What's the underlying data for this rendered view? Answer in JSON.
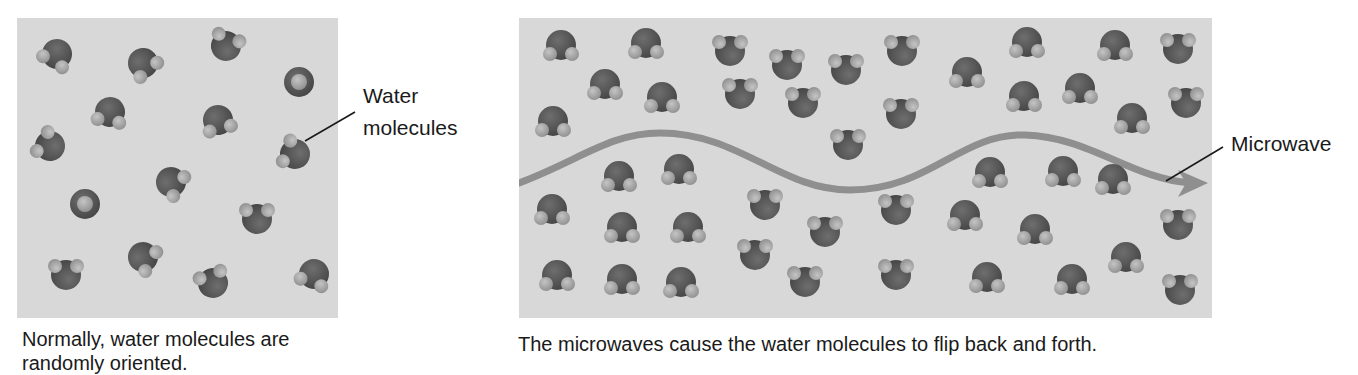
{
  "figure": {
    "left_panel": {
      "label": {
        "line1": "Water",
        "line2": "molecules"
      },
      "caption": {
        "line1": "Normally, water molecules are",
        "line2": "randomly oriented."
      },
      "molecules": [
        {
          "x": 57,
          "y": 54,
          "rot": 30
        },
        {
          "x": 143,
          "y": 63,
          "rot": -40
        },
        {
          "x": 226,
          "y": 46,
          "rot": 200
        },
        {
          "x": 299,
          "y": 82,
          "rot": 0,
          "front": true
        },
        {
          "x": 110,
          "y": 112,
          "rot": 10
        },
        {
          "x": 218,
          "y": 120,
          "rot": -15
        },
        {
          "x": 50,
          "y": 146,
          "rot": 120
        },
        {
          "x": 295,
          "y": 154,
          "rot": 110
        },
        {
          "x": 171,
          "y": 182,
          "rot": -60
        },
        {
          "x": 85,
          "y": 204,
          "rot": 0,
          "front": true
        },
        {
          "x": 257,
          "y": 219,
          "rot": 180
        },
        {
          "x": 143,
          "y": 257,
          "rot": -60
        },
        {
          "x": 66,
          "y": 275,
          "rot": 180
        },
        {
          "x": 213,
          "y": 283,
          "rot": 160
        },
        {
          "x": 314,
          "y": 274,
          "rot": 20
        }
      ]
    },
    "right_panel": {
      "label": "Microwave",
      "caption": "The microwaves cause the water molecules to flip back and forth.",
      "wave_path": "M519,183 C580,160 610,133 660,133 C740,133 780,190 850,190 C930,190 960,133 1025,135 C1090,137 1130,178 1190,183",
      "molecules_down": [
        {
          "x": 561,
          "y": 45
        },
        {
          "x": 646,
          "y": 43
        },
        {
          "x": 605,
          "y": 84
        },
        {
          "x": 662,
          "y": 97
        },
        {
          "x": 553,
          "y": 121
        },
        {
          "x": 1027,
          "y": 42
        },
        {
          "x": 967,
          "y": 72
        },
        {
          "x": 1115,
          "y": 45
        },
        {
          "x": 1080,
          "y": 88
        },
        {
          "x": 1024,
          "y": 96
        },
        {
          "x": 1132,
          "y": 118
        },
        {
          "x": 619,
          "y": 176
        },
        {
          "x": 679,
          "y": 169
        },
        {
          "x": 552,
          "y": 209
        },
        {
          "x": 622,
          "y": 227
        },
        {
          "x": 688,
          "y": 227
        },
        {
          "x": 557,
          "y": 275
        },
        {
          "x": 622,
          "y": 279
        },
        {
          "x": 681,
          "y": 282
        },
        {
          "x": 990,
          "y": 172
        },
        {
          "x": 1063,
          "y": 171
        },
        {
          "x": 965,
          "y": 215
        },
        {
          "x": 1035,
          "y": 229
        },
        {
          "x": 1113,
          "y": 179
        },
        {
          "x": 1126,
          "y": 257
        },
        {
          "x": 987,
          "y": 277
        },
        {
          "x": 1072,
          "y": 279
        }
      ],
      "molecules_up": [
        {
          "x": 730,
          "y": 51
        },
        {
          "x": 787,
          "y": 65
        },
        {
          "x": 846,
          "y": 70
        },
        {
          "x": 740,
          "y": 94
        },
        {
          "x": 803,
          "y": 103
        },
        {
          "x": 848,
          "y": 145
        },
        {
          "x": 902,
          "y": 51
        },
        {
          "x": 1178,
          "y": 49
        },
        {
          "x": 901,
          "y": 114
        },
        {
          "x": 1186,
          "y": 103
        },
        {
          "x": 765,
          "y": 205
        },
        {
          "x": 825,
          "y": 232
        },
        {
          "x": 755,
          "y": 255
        },
        {
          "x": 805,
          "y": 282
        },
        {
          "x": 896,
          "y": 210
        },
        {
          "x": 1178,
          "y": 225
        },
        {
          "x": 896,
          "y": 275
        },
        {
          "x": 1180,
          "y": 290
        }
      ]
    },
    "colors": {
      "panel_bg": "#d8d8d8",
      "oxygen": "#555555",
      "hydrogen": "#aaaaaa",
      "wave": "#8f8f8f",
      "text": "#1a1a1a"
    }
  }
}
